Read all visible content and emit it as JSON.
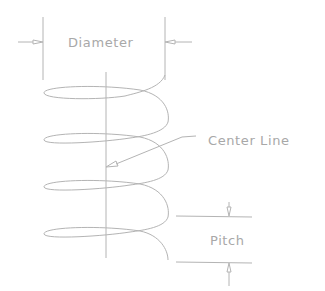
{
  "diagram": {
    "type": "helix-spring-dimension-drawing",
    "labels": {
      "diameter": "Diameter",
      "center_line": "Center Line",
      "pitch": "Pitch"
    },
    "colors": {
      "stroke": "#b0b0b0",
      "text": "#a8a8a8",
      "background": "#ffffff"
    },
    "coil_count": 4
  }
}
